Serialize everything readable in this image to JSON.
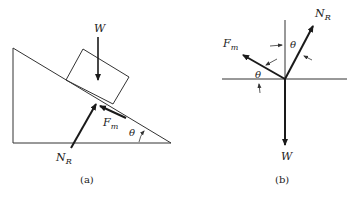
{
  "figure_a": {
    "caption": "(a)",
    "labels": {
      "weight": "W",
      "normal_main": "N",
      "normal_sub": "R",
      "friction_main": "F",
      "friction_sub": "m",
      "angle": "θ"
    }
  },
  "figure_b": {
    "caption": "(b)",
    "labels": {
      "weight": "W",
      "normal_main": "N",
      "normal_sub": "R",
      "friction_main": "F",
      "friction_sub": "m",
      "angle_top": "θ",
      "angle_bottom": "θ"
    }
  },
  "colors": {
    "line": "#333333",
    "arrow": "#1a1a1a"
  }
}
